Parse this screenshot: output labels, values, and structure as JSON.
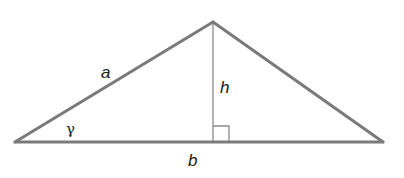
{
  "diagram": {
    "colors": {
      "stroke": "#7a7a7a",
      "altitude": "#8a8a8a",
      "text": "#1a1a1a",
      "background": "#ffffff"
    },
    "vertices": {
      "left": [
        15,
        142
      ],
      "apex": [
        213,
        22
      ],
      "right": [
        383,
        142
      ]
    },
    "altitude": {
      "from": [
        213,
        22
      ],
      "to": [
        213,
        142
      ]
    },
    "right_angle_marker": {
      "x": 213,
      "y": 126,
      "size": 16
    },
    "labels": {
      "side_a": "a",
      "height": "h",
      "angle": "γ",
      "base": "b"
    }
  }
}
